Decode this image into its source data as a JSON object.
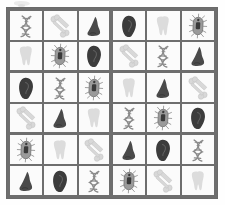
{
  "page": {
    "background_color": "#fefefe"
  },
  "grid": {
    "rows": 6,
    "columns": 6,
    "box_rows": 2,
    "box_columns": 3,
    "border_color": "#6e6e6e",
    "cell_background": "#fbfbfb",
    "gridline_color": "#6e6e6e"
  },
  "legend": {
    "symbols": [
      {
        "key": "dna",
        "label": "DNA double helix",
        "icon": "dna-icon",
        "color": "#8b8b8b"
      },
      {
        "key": "bone",
        "label": "Bone",
        "icon": "bone-icon",
        "color": "#d8d8d8"
      },
      {
        "key": "nose",
        "label": "Nose",
        "icon": "nose-icon",
        "color": "#4a4a4a"
      },
      {
        "key": "ear",
        "label": "Ear",
        "icon": "ear-icon",
        "color": "#3c3c3c"
      },
      {
        "key": "tooth",
        "label": "Tooth",
        "icon": "tooth-icon",
        "color": "#dcdcdc"
      },
      {
        "key": "bacteria",
        "label": "Bacterium",
        "icon": "bacteria-icon",
        "color": "#9a9a9a"
      }
    ]
  },
  "cells": [
    {
      "row": 1,
      "col": 1,
      "symbol": "dna"
    },
    {
      "row": 1,
      "col": 2,
      "symbol": "bone"
    },
    {
      "row": 1,
      "col": 3,
      "symbol": "nose"
    },
    {
      "row": 1,
      "col": 4,
      "symbol": "ear"
    },
    {
      "row": 1,
      "col": 5,
      "symbol": "tooth"
    },
    {
      "row": 1,
      "col": 6,
      "symbol": "bacteria"
    },
    {
      "row": 2,
      "col": 1,
      "symbol": "tooth"
    },
    {
      "row": 2,
      "col": 2,
      "symbol": "bacteria"
    },
    {
      "row": 2,
      "col": 3,
      "symbol": "ear"
    },
    {
      "row": 2,
      "col": 4,
      "symbol": "bone"
    },
    {
      "row": 2,
      "col": 5,
      "symbol": "dna"
    },
    {
      "row": 2,
      "col": 6,
      "symbol": "nose"
    },
    {
      "row": 3,
      "col": 1,
      "symbol": "ear"
    },
    {
      "row": 3,
      "col": 2,
      "symbol": "dna"
    },
    {
      "row": 3,
      "col": 3,
      "symbol": "bacteria"
    },
    {
      "row": 3,
      "col": 4,
      "symbol": "tooth"
    },
    {
      "row": 3,
      "col": 5,
      "symbol": "nose"
    },
    {
      "row": 3,
      "col": 6,
      "symbol": "bone"
    },
    {
      "row": 4,
      "col": 1,
      "symbol": "bone"
    },
    {
      "row": 4,
      "col": 2,
      "symbol": "nose"
    },
    {
      "row": 4,
      "col": 3,
      "symbol": "tooth"
    },
    {
      "row": 4,
      "col": 4,
      "symbol": "dna"
    },
    {
      "row": 4,
      "col": 5,
      "symbol": "bacteria"
    },
    {
      "row": 4,
      "col": 6,
      "symbol": "ear"
    },
    {
      "row": 5,
      "col": 1,
      "symbol": "bacteria"
    },
    {
      "row": 5,
      "col": 2,
      "symbol": "tooth"
    },
    {
      "row": 5,
      "col": 3,
      "symbol": "bone"
    },
    {
      "row": 5,
      "col": 4,
      "symbol": "nose"
    },
    {
      "row": 5,
      "col": 5,
      "symbol": "ear"
    },
    {
      "row": 5,
      "col": 6,
      "symbol": "dna"
    },
    {
      "row": 6,
      "col": 1,
      "symbol": "nose"
    },
    {
      "row": 6,
      "col": 2,
      "symbol": "ear"
    },
    {
      "row": 6,
      "col": 3,
      "symbol": "dna"
    },
    {
      "row": 6,
      "col": 4,
      "symbol": "bacteria"
    },
    {
      "row": 6,
      "col": 5,
      "symbol": "bone"
    },
    {
      "row": 6,
      "col": 6,
      "symbol": "tooth"
    }
  ]
}
